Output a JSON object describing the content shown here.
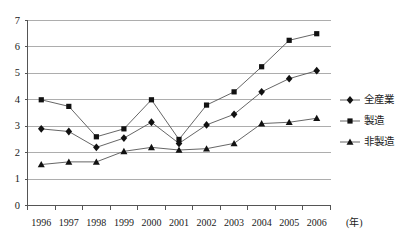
{
  "chart_data": {
    "type": "line",
    "title": "",
    "xlabel": "(年)",
    "ylabel": "",
    "categories": [
      "1996",
      "1997",
      "1998",
      "1999",
      "2000",
      "2001",
      "2002",
      "2003",
      "2004",
      "2005",
      "2006"
    ],
    "ylim": [
      0,
      7
    ],
    "yticks": [
      "0",
      "1",
      "2",
      "3",
      "4",
      "5",
      "6",
      "7"
    ],
    "grid": true,
    "legend_position": "right",
    "series": [
      {
        "name": "全産業",
        "marker": "diamond",
        "values": [
          2.9,
          2.8,
          2.2,
          2.55,
          3.15,
          2.35,
          3.05,
          3.45,
          4.3,
          4.8,
          5.1
        ]
      },
      {
        "name": "製造",
        "marker": "square",
        "values": [
          4.0,
          3.75,
          2.6,
          2.9,
          4.0,
          2.5,
          3.8,
          4.3,
          5.25,
          6.25,
          6.5
        ]
      },
      {
        "name": "非製造",
        "marker": "triangle",
        "values": [
          1.55,
          1.65,
          1.65,
          2.05,
          2.2,
          2.1,
          2.15,
          2.35,
          3.1,
          3.15,
          3.3
        ]
      }
    ]
  },
  "axis": {
    "x_unit_label": "(年)"
  },
  "colors": {
    "line": "#555555",
    "marker": "#111111",
    "grid": "#999999",
    "axis": "#555555",
    "text": "#1a1a1a"
  }
}
